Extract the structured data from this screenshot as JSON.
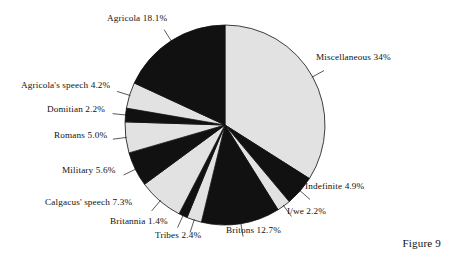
{
  "figure": {
    "caption": "Figure 9"
  },
  "chart_data": {
    "type": "pie",
    "title": "",
    "xlabel": "",
    "ylabel": "",
    "grid": false,
    "legend": "none",
    "start_angle_deg": 0,
    "direction": "clockwise",
    "units": "percent",
    "total": 100,
    "colors": {
      "dark": "#111111",
      "light": "#e2e2e2",
      "outline": "#111111",
      "background": "#ffffff"
    },
    "categories": [
      "Miscellaneous",
      "Indefinite",
      "I/we",
      "Britons",
      "Tribes",
      "Britannia",
      "Calgacus' speech",
      "Military",
      "Romans",
      "Domitian",
      "Agricola's speech",
      "Agricola"
    ],
    "values": [
      34,
      4.9,
      2.2,
      12.7,
      2.4,
      1.4,
      7.3,
      5.6,
      5.0,
      2.2,
      4.2,
      18.1
    ],
    "slice_fills": [
      "light",
      "dark",
      "light",
      "dark",
      "light",
      "dark",
      "light",
      "dark",
      "light",
      "dark",
      "light",
      "dark"
    ],
    "slices": [
      {
        "label": "Miscellaneous 34%",
        "name": "Miscellaneous",
        "value": 34,
        "fill": "light"
      },
      {
        "label": "Indefinite 4.9%",
        "name": "Indefinite",
        "value": 4.9,
        "fill": "dark"
      },
      {
        "label": "I/we 2.2%",
        "name": "I/we",
        "value": 2.2,
        "fill": "light"
      },
      {
        "label": "Britons 12.7%",
        "name": "Britons",
        "value": 12.7,
        "fill": "dark"
      },
      {
        "label": "Tribes 2.4%",
        "name": "Tribes",
        "value": 2.4,
        "fill": "light"
      },
      {
        "label": "Britannia 1.4%",
        "name": "Britannia",
        "value": 1.4,
        "fill": "dark"
      },
      {
        "label": "Calgacus' speech 7.3%",
        "name": "Calgacus' speech",
        "value": 7.3,
        "fill": "light"
      },
      {
        "label": "Military 5.6%",
        "name": "Military",
        "value": 5.6,
        "fill": "dark"
      },
      {
        "label": "Romans 5.0%",
        "name": "Romans",
        "value": 5.0,
        "fill": "light"
      },
      {
        "label": "Domitian 2.2%",
        "name": "Domitian",
        "value": 2.2,
        "fill": "dark"
      },
      {
        "label": "Agricola's speech 4.2%",
        "name": "Agricola's speech",
        "value": 4.2,
        "fill": "light"
      },
      {
        "label": "Agricola 18.1%",
        "name": "Agricola",
        "value": 18.1,
        "fill": "dark"
      }
    ]
  }
}
